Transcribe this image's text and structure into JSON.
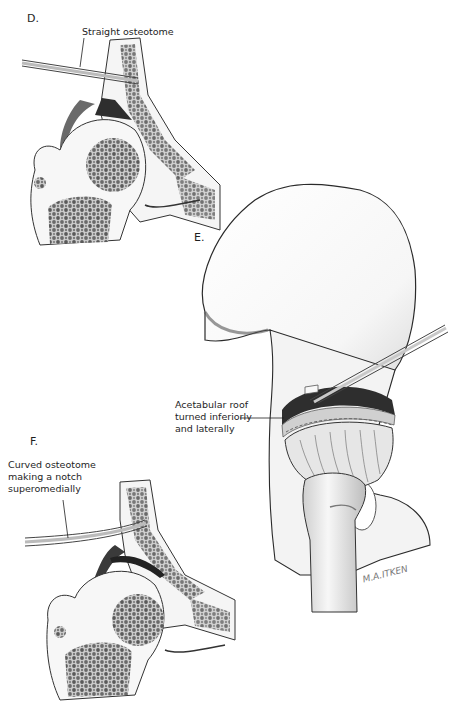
{
  "figure": {
    "panels": [
      {
        "id": "D",
        "letter": "D.",
        "callouts": [
          {
            "text": "Straight osteotome"
          }
        ]
      },
      {
        "id": "E",
        "letter": "E.",
        "callouts": [
          {
            "lines": [
              "Acetabular roof",
              "turned inferiorly",
              "and laterally"
            ]
          }
        ]
      },
      {
        "id": "F",
        "letter": "F.",
        "callouts": [
          {
            "lines": [
              "Curved osteotome",
              "making a notch",
              "superomedially"
            ]
          }
        ]
      }
    ],
    "signature": "M.A.ITKEN",
    "colors": {
      "background": "#ffffff",
      "ink": "#1e1e1e",
      "bone_fill": "#f4f4f4",
      "cancellous": "#555555",
      "shadow": "#3a3a3a"
    }
  }
}
